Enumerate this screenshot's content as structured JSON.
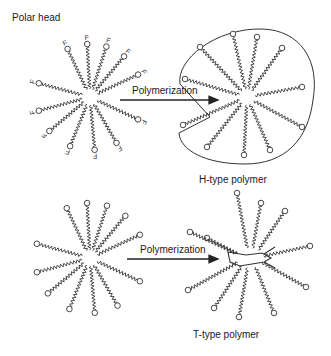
{
  "labels": {
    "polar_head": "Polar head",
    "arrow_top": "Polymerization",
    "arrow_bottom": "Polymerization",
    "h_type": "H-type polymer",
    "t_type": "T-type polymer"
  },
  "colors": {
    "stroke": "#333333",
    "background": "#ffffff"
  },
  "diagram": {
    "panels": [
      {
        "name": "monomer-micelle-with-F-heads",
        "head_glyph": "F"
      },
      {
        "name": "h-type-polymer-vesicle"
      },
      {
        "name": "monomer-micelle"
      },
      {
        "name": "t-type-polymer"
      }
    ]
  }
}
